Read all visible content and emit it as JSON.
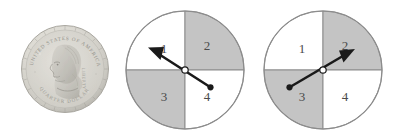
{
  "figure": {
    "background_color": "#ffffff",
    "items": [
      {
        "name": "quarter-coin",
        "kind": "photo"
      },
      {
        "name": "spinner-1",
        "kind": "spinner"
      },
      {
        "name": "spinner-2",
        "kind": "spinner"
      }
    ]
  },
  "coin": {
    "name": "us-quarter",
    "denomination": "QUARTER DOLLAR",
    "legend_top": "UNITED STATES OF AMERICA",
    "legend_bottom": "QUARTER DOLLAR",
    "motto": "LIBERTY",
    "portrait": "washington-profile",
    "face": "obverse",
    "body_color": "#d8d8d4",
    "rim_color": "#b4b4ae",
    "relief_color": "#c2c2bd"
  },
  "spinners": [
    {
      "name": "spinner-1",
      "outline_color": "#8c8c8c",
      "shaded_color": "#c4c4c4",
      "unshaded_color": "#ffffff",
      "pointer_color": "#1a1a1a",
      "pointer_target_sector": "1",
      "pointer_angle_degrees": 148,
      "sectors": [
        {
          "label": "1",
          "position": "top-left",
          "shaded": false,
          "label_x": 40,
          "label_y": 40
        },
        {
          "label": "2",
          "position": "top-right",
          "shaded": true,
          "label_x": 82,
          "label_y": 38
        },
        {
          "label": "3",
          "position": "bottom-left",
          "shaded": true,
          "label_x": 40,
          "label_y": 88
        },
        {
          "label": "4",
          "position": "bottom-right",
          "shaded": false,
          "label_x": 82,
          "label_y": 88
        }
      ]
    },
    {
      "name": "spinner-2",
      "outline_color": "#8c8c8c",
      "shaded_color": "#c4c4c4",
      "unshaded_color": "#ffffff",
      "pointer_color": "#1a1a1a",
      "pointer_target_sector": "2",
      "pointer_angle_degrees": 29,
      "sectors": [
        {
          "label": "1",
          "position": "top-left",
          "shaded": false,
          "label_x": 40,
          "label_y": 40
        },
        {
          "label": "2",
          "position": "top-right",
          "shaded": true,
          "label_x": 82,
          "label_y": 38
        },
        {
          "label": "3",
          "position": "bottom-left",
          "shaded": true,
          "label_x": 40,
          "label_y": 88
        },
        {
          "label": "4",
          "position": "bottom-right",
          "shaded": false,
          "label_x": 82,
          "label_y": 88
        }
      ]
    }
  ]
}
